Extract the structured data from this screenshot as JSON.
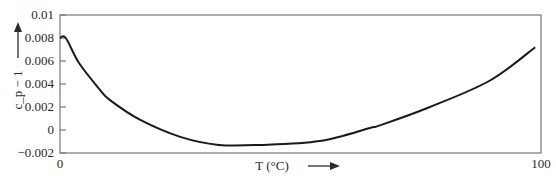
{
  "chart_data": {
    "type": "line",
    "title": "",
    "xlabel": "T (°C)",
    "ylabel": "c_p − 1",
    "xlim": [
      0,
      100
    ],
    "ylim": [
      -0.002,
      0.01
    ],
    "grid": false,
    "xticks": [
      0,
      100
    ],
    "xtick_labels": [
      "0",
      "100"
    ],
    "yticks": [
      0.01,
      0.008,
      0.006,
      0.004,
      0.002,
      0,
      -0.002
    ],
    "ytick_labels": [
      "0.01",
      "0.008",
      "0.006",
      "0.004",
      "0.002",
      "0",
      "−0.002"
    ],
    "series": [
      {
        "name": "c_p − 1",
        "color": "#1a1a1a",
        "x": [
          0,
          1.2,
          4,
          8.3,
          10.4,
          16.6,
          25,
          33,
          41.6,
          54,
          64.4,
          66.5,
          76.9,
          89.4,
          98.8
        ],
        "y": [
          0.008,
          0.008,
          0.0058,
          0.0035,
          0.0026,
          0.0009,
          -0.0006,
          -0.0013,
          -0.0013,
          -0.00096,
          0.00017,
          0.0004,
          0.002,
          0.0043,
          0.0072
        ]
      }
    ]
  }
}
